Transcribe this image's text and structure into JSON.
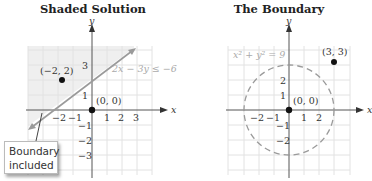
{
  "left": {
    "title": "Shaded Solution",
    "inequality_label": "2x − 3y ≤ −6",
    "point_test": "(−2, 2)",
    "point_origin": "(0, 0)",
    "y_axis_label": "y",
    "x_axis_label": "x",
    "x_ticks": [
      "−2",
      "−1",
      "1",
      "2",
      "3"
    ],
    "y_ticks": [
      "3",
      "1",
      "−1",
      "−2",
      "−3"
    ],
    "callout_line1": "Boundary",
    "callout_line2": "included"
  },
  "right": {
    "title": "The Boundary",
    "equation_label": "x² + y² = 9",
    "point_outside": "(3, 3)",
    "point_origin": "(0, 0)",
    "y_axis_label": "y",
    "x_axis_label": "x",
    "x_ticks": [
      "−2",
      "−1",
      "1",
      "2"
    ],
    "y_ticks": [
      "2",
      "1",
      "−1",
      "−2"
    ]
  },
  "colors": {
    "grid": "#e4e4e4",
    "shade": "#f0f0f0",
    "boundary_line": "#9a9a9a",
    "axis": "#555555",
    "label_gray": "#aaaaaa"
  }
}
